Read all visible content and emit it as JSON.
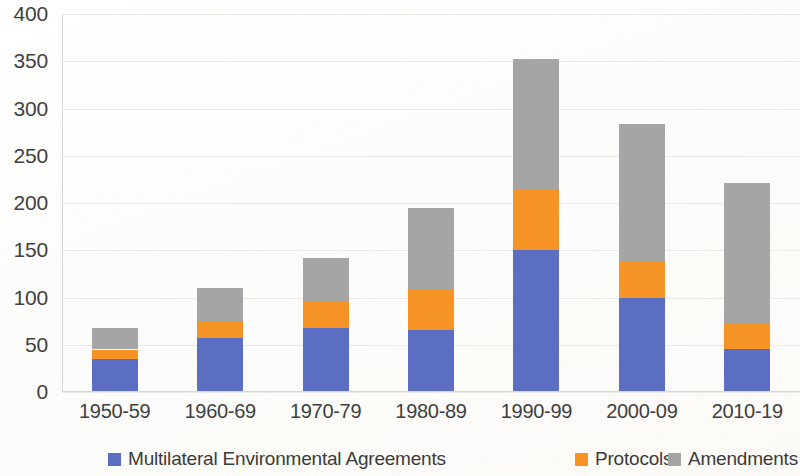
{
  "chart_data": {
    "type": "bar",
    "subtype": "stacked-vertical",
    "title": "",
    "subtitle": "",
    "xlabel": "",
    "ylabel": "",
    "ylim": [
      0,
      400
    ],
    "ytick_values": [
      0,
      50,
      100,
      150,
      200,
      250,
      300,
      350,
      400
    ],
    "ytick_labels": [
      "0",
      "50",
      "100",
      "150",
      "200",
      "250",
      "300",
      "350",
      "400"
    ],
    "grid": true,
    "grid_axis": "y",
    "legend_position": "bottom",
    "categories": [
      "1950-59",
      "1960-69",
      "1970-79",
      "1980-89",
      "1990-99",
      "2000-09",
      "2010-19"
    ],
    "series": [
      {
        "name": "Multilateral Environmental Agreements",
        "color": "#5B6EC2",
        "values": [
          35,
          57,
          68,
          66,
          150,
          100,
          45
        ]
      },
      {
        "name": "Protocols",
        "color": "#F59324",
        "values": [
          10,
          17,
          27,
          43,
          64,
          39,
          28
        ]
      },
      {
        "name": "Amendments",
        "color": "#A5A5A5",
        "values": [
          23,
          36,
          47,
          86,
          138,
          145,
          148
        ]
      }
    ],
    "totals": [
      68,
      110,
      142,
      195,
      352,
      284,
      221
    ]
  },
  "legend": {
    "items": [
      {
        "label": "Multilateral Environmental Agreements",
        "color": "#5B6EC2",
        "swatch": "legend-swatch-meas"
      },
      {
        "label": "Protocols",
        "color": "#F59324",
        "swatch": "legend-swatch-protocols"
      },
      {
        "label": "Amendments",
        "color": "#A5A5A5",
        "swatch": "legend-swatch-amendments"
      }
    ]
  }
}
